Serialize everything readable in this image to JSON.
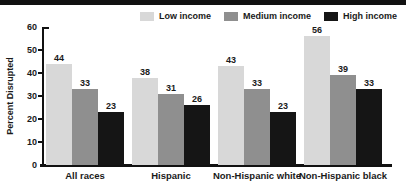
{
  "chart_data": {
    "type": "bar",
    "title": "",
    "xlabel": "",
    "ylabel": "Percent Disrupted",
    "ylim": [
      0,
      60
    ],
    "ytick_step": 10,
    "grid": false,
    "legend_position": "top-right",
    "bar_value_labels": true,
    "categories": [
      "All races",
      "Hispanic",
      "Non-Hispanic white",
      "Non-Hispanic black"
    ],
    "series": [
      {
        "name": "Low income",
        "color": "#d8d8d8",
        "values": [
          44,
          38,
          43,
          56
        ]
      },
      {
        "name": "Medium income",
        "color": "#8f8f8f",
        "values": [
          33,
          31,
          33,
          39
        ]
      },
      {
        "name": "High income",
        "color": "#151515",
        "values": [
          23,
          26,
          23,
          33
        ]
      }
    ]
  },
  "colors": {
    "top_strip": "#111111",
    "axis": "#111111",
    "text": "#1a1a1a",
    "background": "#ffffff"
  }
}
